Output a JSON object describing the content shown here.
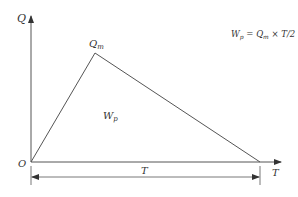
{
  "diagram": {
    "colors": {
      "line": "#555555",
      "text": "#333333",
      "background": "#ffffff"
    },
    "axes": {
      "y_label": "Q",
      "x_label": "T",
      "origin_label": "O"
    },
    "peak_label": "Q",
    "peak_label_sub": "m",
    "area_label": "W",
    "area_label_sub": "p",
    "duration_label": "T",
    "formula": {
      "lhs": "W",
      "lhs_sub": "p",
      "eq": " = ",
      "q": "Q",
      "q_sub": "m",
      "rest": " × T/2"
    }
  }
}
